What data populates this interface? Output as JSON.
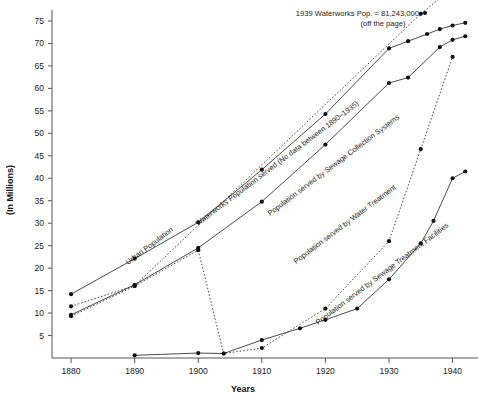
{
  "chart_data": {
    "type": "line",
    "title": "",
    "xlabel": "Years",
    "ylabel": "(In Millions)",
    "xlim": [
      1877,
      1944
    ],
    "ylim": [
      0,
      77
    ],
    "xticks": [
      1880,
      1890,
      1900,
      1910,
      1920,
      1930,
      1940
    ],
    "yticks": [
      5,
      10,
      15,
      20,
      25,
      30,
      35,
      40,
      45,
      50,
      55,
      60,
      65,
      70,
      75
    ],
    "grid": false,
    "legend": "inline-rotated-labels",
    "annotations": [
      {
        "name": "waterworks-offpage-note",
        "line1": "1939 Waterworks Pop. = 81,243,000",
        "line2": "(off the page)"
      }
    ],
    "series": [
      {
        "name": "Urban Population",
        "style": "solid",
        "label": "Urban Population",
        "points": [
          {
            "x": 1880,
            "y": 14.2
          },
          {
            "x": 1890,
            "y": 22.1
          },
          {
            "x": 1900,
            "y": 30.2
          },
          {
            "x": 1910,
            "y": 41.9
          },
          {
            "x": 1920,
            "y": 54.3
          },
          {
            "x": 1930,
            "y": 68.9
          },
          {
            "x": 1933,
            "y": 70.5
          },
          {
            "x": 1936,
            "y": 72.1
          },
          {
            "x": 1938,
            "y": 73.2
          },
          {
            "x": 1940,
            "y": 74.0
          },
          {
            "x": 1942,
            "y": 74.6
          }
        ]
      },
      {
        "name": "Waterworks Population served",
        "style": "dotted",
        "label": "Waterworks Population served (No data between 1890–1935)",
        "points": [
          {
            "x": 1880,
            "y": 11.5
          },
          {
            "x": 1890,
            "y": 16.1
          },
          {
            "x": 1935,
            "y": 76.6
          },
          {
            "x": 1939,
            "y": 81.2
          }
        ]
      },
      {
        "name": "Population served by Sewage Collection Systems",
        "style": "solid",
        "label": "Population served by Sewage Collection Systems",
        "points": [
          {
            "x": 1880,
            "y": 9.6
          },
          {
            "x": 1890,
            "y": 16.3
          },
          {
            "x": 1900,
            "y": 24.5
          },
          {
            "x": 1910,
            "y": 34.8
          },
          {
            "x": 1920,
            "y": 47.5
          },
          {
            "x": 1930,
            "y": 61.2
          },
          {
            "x": 1933,
            "y": 62.4
          },
          {
            "x": 1938,
            "y": 69.2
          },
          {
            "x": 1940,
            "y": 70.8
          },
          {
            "x": 1942,
            "y": 71.6
          }
        ]
      },
      {
        "name": "Population served by Water Treatment",
        "style": "dotted",
        "label": "Population served by Water Treatment",
        "points": [
          {
            "x": 1880,
            "y": 9.3
          },
          {
            "x": 1890,
            "y": 16.0
          },
          {
            "x": 1900,
            "y": 24.0
          },
          {
            "x": 1904,
            "y": 1.0
          },
          {
            "x": 1910,
            "y": 2.2
          },
          {
            "x": 1920,
            "y": 11.0
          },
          {
            "x": 1930,
            "y": 26.0
          },
          {
            "x": 1935,
            "y": 46.5
          },
          {
            "x": 1940,
            "y": 67.0
          }
        ]
      },
      {
        "name": "Population served by Sewage Treatment Facilities",
        "style": "solid",
        "label": "Population served by Sewage Treatment Facilities",
        "points": [
          {
            "x": 1890,
            "y": 0.6
          },
          {
            "x": 1900,
            "y": 1.1
          },
          {
            "x": 1904,
            "y": 1.0
          },
          {
            "x": 1910,
            "y": 4.0
          },
          {
            "x": 1916,
            "y": 6.6
          },
          {
            "x": 1920,
            "y": 8.5
          },
          {
            "x": 1925,
            "y": 11.0
          },
          {
            "x": 1930,
            "y": 17.5
          },
          {
            "x": 1935,
            "y": 25.5
          },
          {
            "x": 1937,
            "y": 30.5
          },
          {
            "x": 1940,
            "y": 40.0
          },
          {
            "x": 1942,
            "y": 41.5
          }
        ]
      }
    ]
  }
}
